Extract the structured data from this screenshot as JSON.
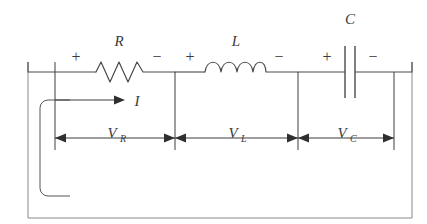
{
  "figure": {
    "type": "circuit-diagram",
    "background_color": "#ffffff",
    "line_color": "#4a4a4a",
    "frame_color": "#8a8a8a"
  },
  "components": {
    "resistor": {
      "label": "R",
      "plus_sign": "+",
      "minus_sign": "−",
      "symbol": "zigzag"
    },
    "inductor": {
      "label": "L",
      "plus_sign": "+",
      "minus_sign": "−",
      "symbol": "coil"
    },
    "capacitor": {
      "label": "C",
      "plus_sign": "+",
      "minus_sign": "−",
      "symbol": "parallel-plates"
    }
  },
  "current": {
    "label": "I",
    "direction": "right"
  },
  "voltages": [
    {
      "name": "v-r",
      "base": "V",
      "subscript": "R"
    },
    {
      "name": "v-l",
      "base": "V",
      "subscript": "L"
    },
    {
      "name": "v-c",
      "base": "V",
      "subscript": "C"
    }
  ]
}
